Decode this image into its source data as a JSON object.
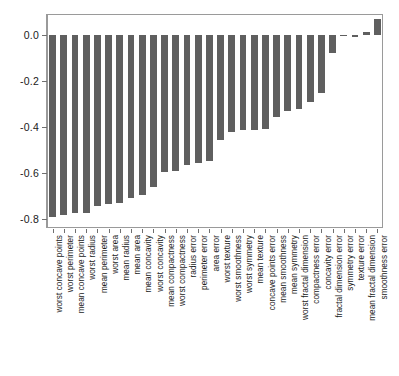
{
  "chart_data": {
    "type": "bar",
    "title": "",
    "subtitle": "",
    "xlabel": "",
    "ylabel": "",
    "orientation": "vertical",
    "grid": false,
    "legend": null,
    "bar_color": "#5f5f5f",
    "frame_color": "#9a9a9a",
    "axis_color": "#6f6f6f",
    "text_color": "#1a1a1a",
    "background": "#ffffff",
    "ylim": [
      -0.84,
      0.09
    ],
    "ytick_labels": [
      "0.0",
      "-0.2",
      "-0.4",
      "-0.6",
      "-0.8"
    ],
    "ytick_values": [
      0.0,
      -0.2,
      -0.4,
      -0.6,
      -0.8
    ],
    "categories": [
      "worst concave points",
      "worst perimeter",
      "mean concave points",
      "worst radius",
      "mean perimeter",
      "worst area",
      "mean radius",
      "mean area",
      "mean concavity",
      "worst concavity",
      "mean compactness",
      "worst compactness",
      "radius error",
      "perimeter error",
      "area error",
      "worst texture",
      "worst smoothness",
      "worst symmetry",
      "mean texture",
      "concave points error",
      "mean smoothness",
      "mean symmetry",
      "worst fractal dimension",
      "compactness error",
      "concavity error",
      "fractal dimension error",
      "symmetry error",
      "texture error",
      "mean fractal dimension",
      "smoothness error"
    ],
    "values": [
      -0.794,
      -0.783,
      -0.777,
      -0.776,
      -0.743,
      -0.734,
      -0.73,
      -0.709,
      -0.696,
      -0.66,
      -0.597,
      -0.591,
      -0.568,
      -0.556,
      -0.548,
      -0.457,
      -0.422,
      -0.416,
      -0.415,
      -0.409,
      -0.359,
      -0.331,
      -0.324,
      -0.293,
      -0.254,
      -0.078,
      -0.007,
      -0.008,
      0.013,
      0.067
    ]
  }
}
